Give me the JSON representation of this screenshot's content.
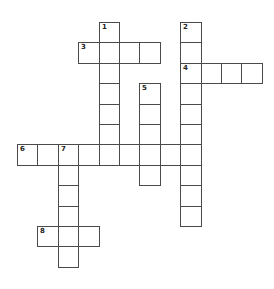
{
  "puzzle": {
    "type": "crossword",
    "grid": {
      "origin_x": 17,
      "origin_y": 22,
      "cell_size": 20.4,
      "border_color": "#4a4a4a",
      "cell_color": "#ffffff"
    },
    "words": [
      {
        "number": "1",
        "direction": "down",
        "row": 0,
        "col": 4,
        "length": 7
      },
      {
        "number": "2",
        "direction": "down",
        "row": 0,
        "col": 8,
        "length": 10
      },
      {
        "number": "3",
        "direction": "across",
        "row": 1,
        "col": 3,
        "length": 4
      },
      {
        "number": "4",
        "direction": "across",
        "row": 2,
        "col": 8,
        "length": 4
      },
      {
        "number": "5",
        "direction": "down",
        "row": 3,
        "col": 6,
        "length": 5
      },
      {
        "number": "6",
        "direction": "across",
        "row": 6,
        "col": 0,
        "length": 9
      },
      {
        "number": "7",
        "direction": "down",
        "row": 6,
        "col": 2,
        "length": 6
      },
      {
        "number": "8",
        "direction": "across",
        "row": 10,
        "col": 1,
        "length": 3
      }
    ]
  }
}
